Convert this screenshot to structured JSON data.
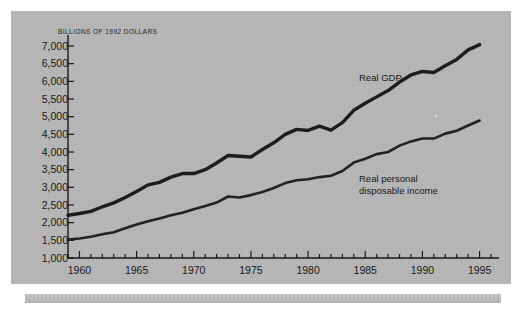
{
  "chart_data": {
    "type": "line",
    "title": "BILLIONS OF 1992 DOLLARS",
    "xlabel": "",
    "ylabel": "BILLIONS OF 1992 DOLLARS",
    "xlim": [
      1959,
      1996
    ],
    "ylim": [
      1000,
      7000
    ],
    "ytick_labels": [
      "7,000",
      "6,500",
      "6,000",
      "5,500",
      "5,000",
      "4,500",
      "4,000",
      "3,500",
      "3,000",
      "2,500",
      "2,000",
      "1,500",
      "1,000"
    ],
    "ytick_values": [
      7000,
      6500,
      6000,
      5500,
      5000,
      4500,
      4000,
      3500,
      3000,
      2500,
      2000,
      1500,
      1000
    ],
    "xtick_labels": [
      "1960",
      "1965",
      "1970",
      "1975",
      "1980",
      "1985",
      "1990",
      "1995"
    ],
    "xtick_values": [
      1960,
      1965,
      1970,
      1975,
      1980,
      1985,
      1990,
      1995
    ],
    "minor_xtick_interval": 1,
    "grid": false,
    "legend_position": "inline-annotation",
    "x": [
      1959,
      1960,
      1961,
      1962,
      1963,
      1964,
      1965,
      1966,
      1967,
      1968,
      1969,
      1970,
      1971,
      1972,
      1973,
      1974,
      1975,
      1976,
      1977,
      1978,
      1979,
      1980,
      1981,
      1982,
      1983,
      1984,
      1985,
      1986,
      1987,
      1988,
      1989,
      1990,
      1991,
      1992,
      1993,
      1994,
      1995
    ],
    "series": [
      {
        "name": "Real GDP",
        "color": "#1a1a1a",
        "values": [
          2210,
          2260,
          2320,
          2450,
          2560,
          2710,
          2880,
          3070,
          3140,
          3290,
          3390,
          3390,
          3500,
          3690,
          3900,
          3880,
          3860,
          4070,
          4260,
          4500,
          4640,
          4610,
          4730,
          4620,
          4830,
          5180,
          5380,
          5560,
          5740,
          5980,
          6180,
          6280,
          6250,
          6440,
          6620,
          6890,
          7040
        ]
      },
      {
        "name": "Real personal\ndisposable income",
        "color": "#1f1f1f",
        "values": [
          1520,
          1550,
          1600,
          1670,
          1730,
          1840,
          1950,
          2040,
          2120,
          2210,
          2280,
          2380,
          2470,
          2570,
          2740,
          2710,
          2780,
          2870,
          2980,
          3120,
          3200,
          3230,
          3290,
          3330,
          3460,
          3700,
          3810,
          3940,
          4000,
          4180,
          4300,
          4380,
          4380,
          4520,
          4600,
          4750,
          4890
        ]
      }
    ],
    "annotations": [
      {
        "text": "Real GDP",
        "x": 1986,
        "y": 6050
      },
      {
        "text": "Real personal\ndisposable income",
        "x": 1986,
        "y": 3650
      }
    ]
  },
  "labels": {
    "axis_title": "BILLIONS OF 1992 DOLLARS",
    "series_gdp": "Real GDP",
    "series_income": "Real personal\ndisposable income"
  },
  "colors": {
    "panel_background": "#b8b8b8",
    "line": "#1a1a1a",
    "text": "#151515",
    "footer_bar": "#bdbdbd"
  }
}
